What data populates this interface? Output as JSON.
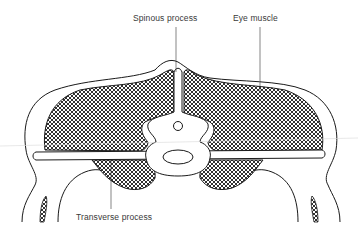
{
  "diagram": {
    "labels": {
      "spinous_process": "Spinous process",
      "eye_muscle": "Eye muscle",
      "transverse_process": "Transverse process"
    },
    "colors": {
      "line": "#1a1a1a",
      "hatch": "#1a1a1a",
      "background": "#ffffff",
      "label_text": "#3a3a3a"
    }
  }
}
